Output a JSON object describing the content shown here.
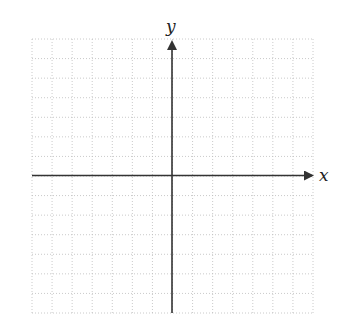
{
  "diagram": {
    "type": "cartesian-coordinate-plane",
    "x_axis_label": "x",
    "y_axis_label": "y",
    "grid": {
      "columns": 14,
      "rows": 14,
      "style": "dotted",
      "color": "#bdbdbd"
    },
    "axis_color": "#333333",
    "quadrants_visible": 4
  }
}
